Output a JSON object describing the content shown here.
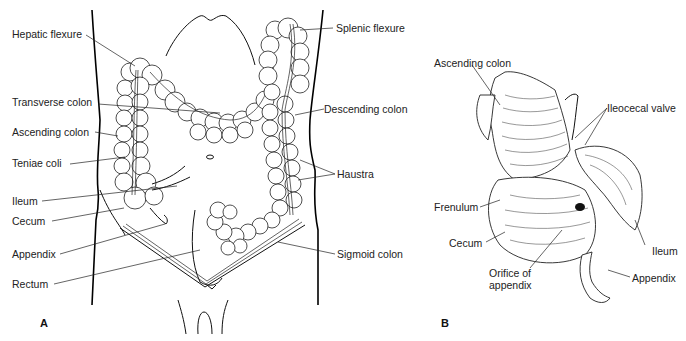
{
  "figure": {
    "panel_a": {
      "letter": "A",
      "labels_left": [
        {
          "text": "Hepatic flexure"
        },
        {
          "text": "Transverse colon"
        },
        {
          "text": "Ascending colon"
        },
        {
          "text": "Teniae coli"
        },
        {
          "text": "Ileum"
        },
        {
          "text": "Cecum"
        },
        {
          "text": "Appendix"
        },
        {
          "text": "Rectum"
        }
      ],
      "labels_right": [
        {
          "text": "Splenic flexure"
        },
        {
          "text": "Descending colon"
        },
        {
          "text": "Haustra"
        },
        {
          "text": "Sigmoid colon"
        }
      ]
    },
    "panel_b": {
      "letter": "B",
      "labels": [
        {
          "text": "Ascending colon"
        },
        {
          "text": "Ileocecal valve"
        },
        {
          "text": "Frenulum"
        },
        {
          "text": "Cecum"
        },
        {
          "text": "Ileum"
        },
        {
          "text": "Orifice of"
        },
        {
          "text": "appendix"
        },
        {
          "text": "Appendix"
        }
      ]
    }
  },
  "colors": {
    "line": "#111111",
    "background": "#ffffff"
  }
}
